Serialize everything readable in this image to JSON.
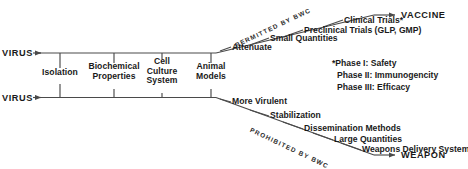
{
  "diagram": {
    "type": "dual-pathway-fork-diagram",
    "trunk": {
      "top_source_label": "VIRUS",
      "bottom_source_label": "VIRUS",
      "stages": [
        {
          "label_line1": "Isolation",
          "label_line2": "",
          "label_line3": ""
        },
        {
          "label_line1": "Biochemical",
          "label_line2": "Properties",
          "label_line3": ""
        },
        {
          "label_line1": "Cell",
          "label_line2": "Culture",
          "label_line3": "System"
        },
        {
          "label_line1": "Animal",
          "label_line2": "Models",
          "label_line3": ""
        }
      ]
    },
    "upper_branch": {
      "legend": "PERMITTED BY BWC",
      "steps": [
        "Attenuate",
        "Small Quantities",
        "Preclinical Trials (GLP, GMP)",
        "Clinical Trials*"
      ],
      "endpoint": "VACCINE"
    },
    "lower_branch": {
      "legend": "PROHIBITED BY BWC",
      "steps": [
        "More Virulent",
        "Stabilization",
        "Dissemination Methods",
        "Large Quantities",
        "Weapons Delivery System"
      ],
      "endpoint": "WEAPON"
    },
    "footnote": {
      "lines": [
        "*Phase I: Safety",
        "Phase II: Immunogencity",
        "Phase III: Efficacy"
      ]
    },
    "colors": {
      "background": "#ffffff",
      "line": "#4a4a4a",
      "text": "#1a1a1a"
    }
  }
}
